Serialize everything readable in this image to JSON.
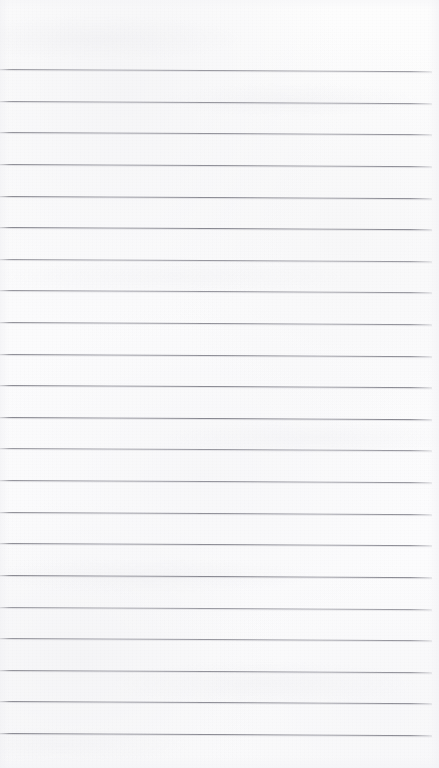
{
  "document": {
    "kind": "scanned-ruled-paper",
    "title": "Blank Ruled Notebook Page",
    "orientation": "portrait",
    "width_px": 439,
    "height_px": 768,
    "has_text_content": false,
    "has_handwriting": false,
    "header_text": "",
    "footer_text": ""
  },
  "colors": {
    "paper": "#fbfbfc",
    "paper_highlight": "#fdfdfd",
    "rule_line": "#74747e",
    "rule_line_light": "#a0a0a8",
    "page_backdrop": "#ffffff"
  },
  "ruling": {
    "line_count": 22,
    "first_line_y": 69,
    "last_line_y": 733,
    "spacing_px": 31.6,
    "line_thickness_px": 1,
    "skew_degrees": 0.3,
    "left_inset_px": 0,
    "right_inset_px": 7,
    "margin_rule": false,
    "margin_rule_x": null
  },
  "margins": {
    "top_blank_px": 69,
    "bottom_blank_px": 35,
    "left_blank_px": 0,
    "right_blank_px": 7
  },
  "zones": {
    "header_margin_label": "",
    "footer_margin_label": ""
  },
  "lines": [
    {
      "index": 1,
      "y": 69.0,
      "content": ""
    },
    {
      "index": 2,
      "y": 100.6,
      "content": ""
    },
    {
      "index": 3,
      "y": 132.2,
      "content": ""
    },
    {
      "index": 4,
      "y": 163.8,
      "content": ""
    },
    {
      "index": 5,
      "y": 195.5,
      "content": ""
    },
    {
      "index": 6,
      "y": 227.1,
      "content": ""
    },
    {
      "index": 7,
      "y": 258.7,
      "content": ""
    },
    {
      "index": 8,
      "y": 290.3,
      "content": ""
    },
    {
      "index": 9,
      "y": 321.9,
      "content": ""
    },
    {
      "index": 10,
      "y": 353.5,
      "content": ""
    },
    {
      "index": 11,
      "y": 385.1,
      "content": ""
    },
    {
      "index": 12,
      "y": 416.8,
      "content": ""
    },
    {
      "index": 13,
      "y": 448.4,
      "content": ""
    },
    {
      "index": 14,
      "y": 480.0,
      "content": ""
    },
    {
      "index": 15,
      "y": 511.6,
      "content": ""
    },
    {
      "index": 16,
      "y": 543.2,
      "content": ""
    },
    {
      "index": 17,
      "y": 574.8,
      "content": ""
    },
    {
      "index": 18,
      "y": 606.5,
      "content": ""
    },
    {
      "index": 19,
      "y": 638.1,
      "content": ""
    },
    {
      "index": 20,
      "y": 669.7,
      "content": ""
    },
    {
      "index": 21,
      "y": 701.3,
      "content": ""
    },
    {
      "index": 22,
      "y": 732.9,
      "content": ""
    }
  ]
}
